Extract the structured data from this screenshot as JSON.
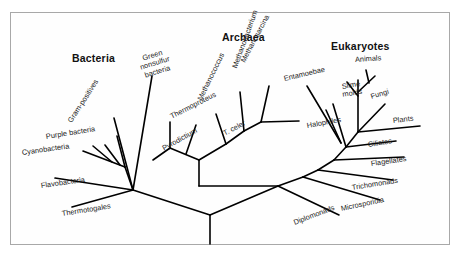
{
  "figure": {
    "border_color": "#a8a8a8",
    "line_color": "#000000",
    "background": "#ffffff"
  },
  "domains": [
    {
      "name": "bacteria-heading",
      "label": "Bacteria",
      "x": 72,
      "y": 52
    },
    {
      "name": "archaea-heading",
      "label": "Archaea",
      "x": 222,
      "y": 31
    },
    {
      "name": "eukaryotes-heading",
      "label": "Eukaryotes",
      "x": 331,
      "y": 40
    }
  ],
  "taxa": {
    "bacteria": [
      {
        "label": "Gram-positives",
        "x": 70,
        "y": 118,
        "rot": -57
      },
      {
        "label": "Green nonsulfur\nbacteria",
        "x": 133,
        "y": 58,
        "rot": -17,
        "two_line": true
      },
      {
        "label": "Purple bacteria",
        "x": 46,
        "y": 133,
        "rot": -9
      },
      {
        "label": "Cyanobacteria",
        "x": 22,
        "y": 149,
        "rot": -8
      },
      {
        "label": "Flavobacteria",
        "x": 41,
        "y": 182,
        "rot": -8
      },
      {
        "label": "Thermotogales",
        "x": 62,
        "y": 210,
        "rot": -9
      }
    ],
    "archaea": [
      {
        "label": "Thermoproteus",
        "x": 171,
        "y": 113,
        "rot": -27
      },
      {
        "label": "T. celer",
        "x": 224,
        "y": 130,
        "rot": -28
      },
      {
        "label": "Pyrodictium",
        "x": 163,
        "y": 145,
        "rot": -29
      },
      {
        "label": "Methanococcus",
        "x": 200,
        "y": 96,
        "rot": -64
      },
      {
        "label": "Methanobacterium",
        "x": 235,
        "y": 64,
        "rot": -70
      },
      {
        "label": "Methanosarcina",
        "x": 243,
        "y": 58,
        "rot": -62
      },
      {
        "label": "Halophiles",
        "x": 307,
        "y": 122,
        "rot": -10
      }
    ],
    "eukaryotes": [
      {
        "label": "Entamoebae",
        "x": 284,
        "y": 75,
        "rot": -13
      },
      {
        "label": "Animals",
        "x": 355,
        "y": 56,
        "rot": -4
      },
      {
        "label": "Slime\nmolds",
        "x": 329,
        "y": 85,
        "rot": -9,
        "two_line": true
      },
      {
        "label": "Fungi",
        "x": 371,
        "y": 93,
        "rot": -17
      },
      {
        "label": "Plants",
        "x": 393,
        "y": 117,
        "rot": -7
      },
      {
        "label": "Ciliates",
        "x": 368,
        "y": 141,
        "rot": -9
      },
      {
        "label": "Flagellates",
        "x": 371,
        "y": 160,
        "rot": -8
      },
      {
        "label": "Trichomonads",
        "x": 352,
        "y": 184,
        "rot": -9
      },
      {
        "label": "Microsporidia",
        "x": 341,
        "y": 205,
        "rot": -12
      },
      {
        "label": "Diplomonads",
        "x": 294,
        "y": 219,
        "rot": -21
      }
    ]
  },
  "tree_edges": {
    "root": [
      {
        "name": "root-stem",
        "x1": 210,
        "y1": 215,
        "x2": 210,
        "y2": 244
      },
      {
        "name": "root-to-bacteria-hub",
        "x1": 210,
        "y1": 215,
        "x2": 133,
        "y2": 190
      },
      {
        "name": "root-to-archaea-hub",
        "x1": 210,
        "y1": 215,
        "x2": 278,
        "y2": 186
      }
    ],
    "bacteria": [
      {
        "name": "edge-thermotogales",
        "x1": 133,
        "y1": 190,
        "x2": 72,
        "y2": 207
      },
      {
        "name": "edge-flavobacteria",
        "x1": 133,
        "y1": 190,
        "x2": 55,
        "y2": 178
      },
      {
        "name": "edge-bacteria-crown",
        "x1": 133,
        "y1": 190,
        "x2": 125,
        "y2": 167
      },
      {
        "name": "edge-cyanobacteria",
        "x1": 125,
        "y1": 167,
        "x2": 83,
        "y2": 151
      },
      {
        "name": "edge-cyano-tip2",
        "x1": 112,
        "y1": 162,
        "x2": 93,
        "y2": 146
      },
      {
        "name": "edge-cyano-tip3",
        "x1": 120,
        "y1": 165,
        "x2": 105,
        "y2": 145
      },
      {
        "name": "edge-purple-bacteria",
        "x1": 125,
        "y1": 167,
        "x2": 117,
        "y2": 136
      },
      {
        "name": "edge-gram-positives",
        "x1": 133,
        "y1": 190,
        "x2": 114,
        "y2": 118
      },
      {
        "name": "edge-green-nonsulfur",
        "x1": 133,
        "y1": 190,
        "x2": 152,
        "y2": 76
      }
    ],
    "archaea": [
      {
        "name": "edge-archaea-stem",
        "x1": 278,
        "y1": 186,
        "x2": 199,
        "y2": 186
      },
      {
        "name": "edge-archaea-trunk",
        "x1": 199,
        "y1": 186,
        "x2": 199,
        "y2": 160
      },
      {
        "name": "edge-crenarchaeota",
        "x1": 199,
        "y1": 160,
        "x2": 170,
        "y2": 148
      },
      {
        "name": "edge-pyrodictium",
        "x1": 170,
        "y1": 148,
        "x2": 153,
        "y2": 160
      },
      {
        "name": "edge-thermoproteus",
        "x1": 170,
        "y1": 148,
        "x2": 170,
        "y2": 122
      },
      {
        "name": "edge-t-celer",
        "x1": 186,
        "y1": 154,
        "x2": 196,
        "y2": 125
      },
      {
        "name": "edge-euryarchaeota",
        "x1": 199,
        "y1": 160,
        "x2": 226,
        "y2": 144
      },
      {
        "name": "edge-methanococcus",
        "x1": 226,
        "y1": 144,
        "x2": 216,
        "y2": 114
      },
      {
        "name": "edge-methano-node2",
        "x1": 226,
        "y1": 144,
        "x2": 244,
        "y2": 131
      },
      {
        "name": "edge-methanobacterium",
        "x1": 244,
        "y1": 131,
        "x2": 240,
        "y2": 92
      },
      {
        "name": "edge-methano-node3",
        "x1": 244,
        "y1": 131,
        "x2": 261,
        "y2": 122
      },
      {
        "name": "edge-methanosarcina",
        "x1": 261,
        "y1": 122,
        "x2": 269,
        "y2": 86
      },
      {
        "name": "edge-halophiles",
        "x1": 261,
        "y1": 122,
        "x2": 299,
        "y2": 121
      }
    ],
    "eukaryotes": [
      {
        "name": "edge-diplomonads",
        "x1": 278,
        "y1": 186,
        "x2": 339,
        "y2": 215
      },
      {
        "name": "edge-euk-node1",
        "x1": 278,
        "y1": 186,
        "x2": 303,
        "y2": 177
      },
      {
        "name": "edge-microsporidia",
        "x1": 303,
        "y1": 177,
        "x2": 380,
        "y2": 200
      },
      {
        "name": "edge-euk-node2",
        "x1": 303,
        "y1": 177,
        "x2": 318,
        "y2": 170
      },
      {
        "name": "edge-trichomonads",
        "x1": 318,
        "y1": 170,
        "x2": 393,
        "y2": 180
      },
      {
        "name": "edge-euk-node3",
        "x1": 318,
        "y1": 170,
        "x2": 334,
        "y2": 160
      },
      {
        "name": "edge-flagellates",
        "x1": 334,
        "y1": 160,
        "x2": 404,
        "y2": 157
      },
      {
        "name": "edge-euk-node4",
        "x1": 334,
        "y1": 160,
        "x2": 346,
        "y2": 147
      },
      {
        "name": "edge-ciliates",
        "x1": 346,
        "y1": 147,
        "x2": 396,
        "y2": 141
      },
      {
        "name": "edge-euk-crown",
        "x1": 346,
        "y1": 147,
        "x2": 358,
        "y2": 132
      },
      {
        "name": "edge-plants",
        "x1": 358,
        "y1": 132,
        "x2": 420,
        "y2": 126
      },
      {
        "name": "edge-fungi",
        "x1": 358,
        "y1": 132,
        "x2": 385,
        "y2": 104
      },
      {
        "name": "edge-slime-molds",
        "x1": 346,
        "y1": 147,
        "x2": 333,
        "y2": 104
      },
      {
        "name": "edge-slime-molds-2",
        "x1": 341,
        "y1": 143,
        "x2": 326,
        "y2": 110
      },
      {
        "name": "edge-entamoebae",
        "x1": 341,
        "y1": 143,
        "x2": 307,
        "y2": 86
      },
      {
        "name": "edge-animals-stem",
        "x1": 358,
        "y1": 132,
        "x2": 358,
        "y2": 80
      },
      {
        "name": "edge-animals-left",
        "x1": 358,
        "y1": 96,
        "x2": 347,
        "y2": 82
      },
      {
        "name": "edge-animals-right",
        "x1": 358,
        "y1": 92,
        "x2": 375,
        "y2": 76
      },
      {
        "name": "edge-animals-right2",
        "x1": 369,
        "y1": 83,
        "x2": 366,
        "y2": 70
      }
    ]
  }
}
